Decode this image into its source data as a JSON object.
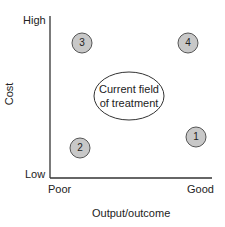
{
  "axes": {
    "y_label": "Cost",
    "y_high": "High",
    "y_low": "Low",
    "x_label": "Output/outcome",
    "x_poor": "Poor",
    "x_good": "Good"
  },
  "points": [
    {
      "id": "1",
      "label": "1",
      "x": "Good",
      "y": "Low"
    },
    {
      "id": "2",
      "label": "2",
      "x": "Poor",
      "y": "Low"
    },
    {
      "id": "3",
      "label": "3",
      "x": "Poor",
      "y": "High"
    },
    {
      "id": "4",
      "label": "4",
      "x": "Good",
      "y": "High"
    }
  ],
  "center": {
    "line1": "Current field",
    "line2": "of treatment"
  },
  "colors": {
    "circle_fill": "#c8c8c8",
    "stroke": "#333333"
  }
}
